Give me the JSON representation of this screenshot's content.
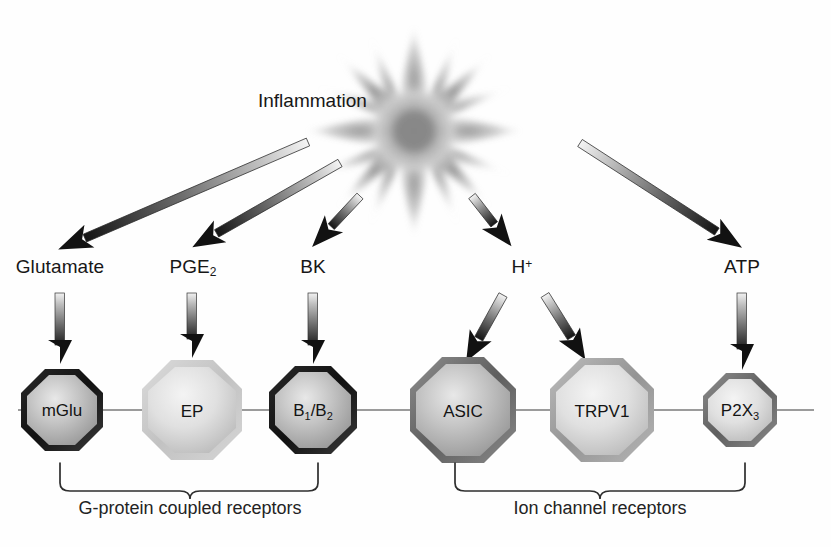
{
  "figure": {
    "title": "Inflammation",
    "source_node": "inflammation-starburst",
    "membrane_line_color": "#6e6e6e",
    "background": "#ffffff"
  },
  "mediators": [
    {
      "id": "glutamate",
      "label": "Glutamate",
      "sub": "",
      "sup": "",
      "x": 60,
      "label_y": 268
    },
    {
      "id": "pge2",
      "label": "PGE",
      "sub": "2",
      "sup": "",
      "x": 193,
      "label_y": 268
    },
    {
      "id": "bk",
      "label": "BK",
      "sub": "",
      "sup": "",
      "x": 313,
      "label_y": 268
    },
    {
      "id": "h-plus",
      "label": "H",
      "sub": "",
      "sup": "+",
      "x": 522,
      "label_y": 268
    },
    {
      "id": "atp",
      "label": "ATP",
      "sub": "",
      "sup": "",
      "x": 742,
      "label_y": 268
    }
  ],
  "receptors": [
    {
      "id": "mglu",
      "label": "mGlu",
      "sub": "",
      "cx": 62,
      "cy": 410,
      "r": 41,
      "ring": "dark",
      "group": "gpcr"
    },
    {
      "id": "ep",
      "label": "EP",
      "sub": "",
      "cx": 192,
      "cy": 410,
      "r": 50,
      "ring": "light",
      "group": "gpcr"
    },
    {
      "id": "b1b2",
      "label": "B",
      "sub": "1/2",
      "cx": 313,
      "cy": 410,
      "r": 44,
      "ring": "dark",
      "group": "gpcr"
    },
    {
      "id": "asic",
      "label": "ASIC",
      "sub": "",
      "cx": 463,
      "cy": 410,
      "r": 53,
      "ring": "mid",
      "group": "ion"
    },
    {
      "id": "trpv1",
      "label": "TRPV1",
      "sub": "",
      "cx": 602,
      "cy": 410,
      "r": 52,
      "ring": "midlight",
      "group": "ion"
    },
    {
      "id": "p2x3",
      "label": "P2X",
      "sub": "3",
      "cx": 740,
      "cy": 410,
      "r": 37,
      "ring": "mid",
      "group": "ion"
    }
  ],
  "groups": [
    {
      "id": "gpcr",
      "caption": "G-protein coupled receptors",
      "brace_x1": 60,
      "brace_x2": 318,
      "caption_cx": 190,
      "caption_y": 498
    },
    {
      "id": "ion",
      "caption": "Ion channel receptors",
      "brace_x1": 455,
      "brace_x2": 745,
      "caption_cx": 600,
      "caption_y": 498
    }
  ],
  "arrows": {
    "from_inflammation": [
      {
        "id": "arrow-to-glutamate",
        "x1": 308,
        "y1": 142,
        "x2": 62,
        "y2": 248
      },
      {
        "id": "arrow-to-pge2",
        "x1": 340,
        "y1": 163,
        "x2": 196,
        "y2": 247
      },
      {
        "id": "arrow-to-bk",
        "x1": 360,
        "y1": 196,
        "x2": 313,
        "y2": 246
      },
      {
        "id": "arrow-to-hplus",
        "x1": 472,
        "y1": 196,
        "x2": 512,
        "y2": 247
      },
      {
        "id": "arrow-to-atp",
        "x1": 580,
        "y1": 143,
        "x2": 742,
        "y2": 248
      }
    ],
    "to_receptors": [
      {
        "id": "arrow-glutamate-mglu",
        "x1": 60,
        "y1": 292,
        "x2": 60,
        "y2": 362,
        "kind": "vertical"
      },
      {
        "id": "arrow-pge2-ep",
        "x1": 192,
        "y1": 292,
        "x2": 192,
        "y2": 356,
        "kind": "vertical"
      },
      {
        "id": "arrow-bk-b1b2",
        "x1": 313,
        "y1": 292,
        "x2": 313,
        "y2": 362,
        "kind": "vertical"
      },
      {
        "id": "arrow-hplus-asic",
        "x1": 497,
        "y1": 297,
        "x2": 464,
        "y2": 356,
        "kind": "diagonal"
      },
      {
        "id": "arrow-hplus-trpv1",
        "x1": 551,
        "y1": 297,
        "x2": 588,
        "y2": 356,
        "kind": "diagonal"
      },
      {
        "id": "arrow-atp-p2x3",
        "x1": 742,
        "y1": 292,
        "x2": 742,
        "y2": 368,
        "kind": "vertical"
      }
    ]
  },
  "membrane": {
    "x_start": 18,
    "x_end": 814,
    "y": 410
  }
}
